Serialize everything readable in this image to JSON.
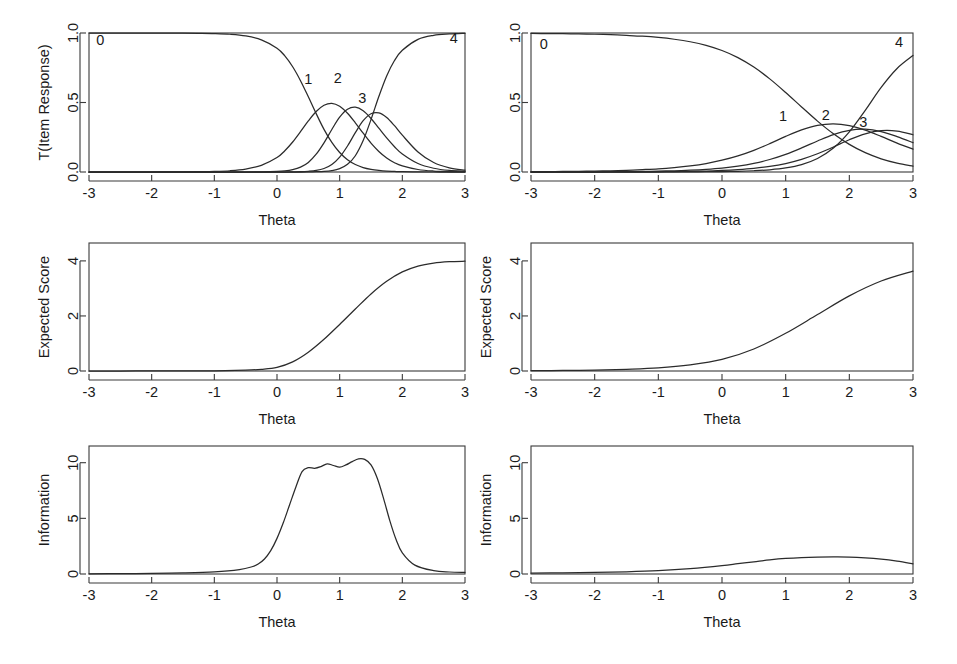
{
  "figure": {
    "width": 957,
    "height": 664,
    "background": "#ffffff",
    "line_color": "#2b2b2b",
    "axis_color": "#3a3a3a",
    "rows": 3,
    "cols": 2,
    "shared_xlabel": "Theta"
  },
  "chart_data": [
    {
      "id": "panel-trace-lines-item-1",
      "position": "top-left",
      "type": "line",
      "title": "",
      "xlabel": "Theta",
      "ylabel": "T(Item Response)",
      "xlim": [
        -3,
        3
      ],
      "ylim": [
        0,
        1
      ],
      "xticks": [
        -3,
        -2,
        -1,
        0,
        1,
        2,
        3
      ],
      "xticklabels": [
        "-3",
        "-2",
        "-1",
        "0",
        "1",
        "2",
        "3"
      ],
      "yticks": [
        0.0,
        0.5,
        1.0
      ],
      "yticklabels": [
        "0.0",
        "0.5",
        "1.0"
      ],
      "grid": false,
      "legend": "inline-curve-labels",
      "x": [
        -3.0,
        -2.75,
        -2.5,
        -2.25,
        -2.0,
        -1.75,
        -1.5,
        -1.25,
        -1.0,
        -0.75,
        -0.5,
        -0.25,
        0.0,
        0.125,
        0.25,
        0.375,
        0.5,
        0.625,
        0.75,
        0.875,
        1.0,
        1.125,
        1.25,
        1.375,
        1.5,
        1.625,
        1.75,
        1.875,
        2.0,
        2.25,
        2.5,
        2.75,
        3.0
      ],
      "series": [
        {
          "name": "0",
          "label": "0",
          "label_x": -2.82,
          "label_y": 0.94,
          "values": [
            1.0,
            1.0,
            1.0,
            1.0,
            1.0,
            0.999,
            0.999,
            0.998,
            0.996,
            0.991,
            0.979,
            0.951,
            0.891,
            0.835,
            0.757,
            0.657,
            0.541,
            0.42,
            0.307,
            0.213,
            0.14,
            0.088,
            0.054,
            0.032,
            0.019,
            0.011,
            0.006,
            0.004,
            0.002,
            0.001,
            0.0,
            0.0,
            0.0
          ]
        },
        {
          "name": "1",
          "label": "1",
          "label_x": 0.5,
          "label_y": 0.66,
          "values": [
            0.0,
            0.0,
            0.0,
            0.0,
            0.0,
            0.001,
            0.001,
            0.002,
            0.004,
            0.009,
            0.021,
            0.048,
            0.104,
            0.153,
            0.216,
            0.29,
            0.367,
            0.435,
            0.48,
            0.494,
            0.473,
            0.423,
            0.354,
            0.279,
            0.208,
            0.148,
            0.101,
            0.067,
            0.044,
            0.018,
            0.007,
            0.003,
            0.001
          ]
        },
        {
          "name": "2",
          "label": "2",
          "label_x": 0.97,
          "label_y": 0.665,
          "values": [
            0.0,
            0.0,
            0.0,
            0.0,
            0.0,
            0.0,
            0.0,
            0.0,
            0.0,
            0.0,
            0.0,
            0.001,
            0.004,
            0.008,
            0.017,
            0.035,
            0.069,
            0.128,
            0.21,
            0.306,
            0.394,
            0.451,
            0.466,
            0.44,
            0.385,
            0.315,
            0.245,
            0.182,
            0.13,
            0.061,
            0.027,
            0.011,
            0.005
          ]
        },
        {
          "name": "3",
          "label": "3",
          "label_x": 1.36,
          "label_y": 0.525,
          "values": [
            0.0,
            0.0,
            0.0,
            0.0,
            0.0,
            0.0,
            0.0,
            0.0,
            0.0,
            0.0,
            0.0,
            0.0,
            0.0,
            0.0,
            0.001,
            0.002,
            0.005,
            0.011,
            0.025,
            0.054,
            0.107,
            0.187,
            0.283,
            0.369,
            0.419,
            0.425,
            0.392,
            0.333,
            0.265,
            0.144,
            0.068,
            0.03,
            0.013
          ]
        },
        {
          "name": "4",
          "label": "4",
          "label_x": 2.82,
          "label_y": 0.955,
          "values": [
            0.0,
            0.0,
            0.0,
            0.0,
            0.0,
            0.0,
            0.0,
            0.0,
            0.0,
            0.0,
            0.0,
            0.0,
            0.0,
            0.0,
            0.0,
            0.0,
            0.001,
            0.002,
            0.004,
            0.01,
            0.024,
            0.055,
            0.117,
            0.226,
            0.377,
            0.543,
            0.691,
            0.802,
            0.876,
            0.954,
            0.983,
            0.993,
            0.998
          ]
        }
      ]
    },
    {
      "id": "panel-trace-lines-item-2",
      "position": "top-right",
      "type": "line",
      "title": "",
      "xlabel": "Theta",
      "ylabel": "",
      "xlim": [
        -3,
        3
      ],
      "ylim": [
        0,
        1
      ],
      "xticks": [
        -3,
        -2,
        -1,
        0,
        1,
        2,
        3
      ],
      "xticklabels": [
        "-3",
        "-2",
        "-1",
        "0",
        "1",
        "2",
        "3"
      ],
      "yticks": [
        0.0,
        0.5,
        1.0
      ],
      "yticklabels": [
        "0.0",
        "0.5",
        "1.0"
      ],
      "grid": false,
      "legend": "inline-curve-labels",
      "x": [
        -3.0,
        -2.75,
        -2.5,
        -2.25,
        -2.0,
        -1.75,
        -1.5,
        -1.25,
        -1.0,
        -0.75,
        -0.5,
        -0.25,
        0.0,
        0.25,
        0.5,
        0.75,
        1.0,
        1.25,
        1.5,
        1.75,
        2.0,
        2.25,
        2.5,
        2.75,
        3.0
      ],
      "series": [
        {
          "name": "0",
          "label": "0",
          "label_x": -2.8,
          "label_y": 0.915,
          "values": [
            0.997,
            0.996,
            0.995,
            0.993,
            0.991,
            0.988,
            0.983,
            0.977,
            0.968,
            0.955,
            0.937,
            0.911,
            0.874,
            0.823,
            0.755,
            0.67,
            0.572,
            0.468,
            0.366,
            0.275,
            0.199,
            0.139,
            0.095,
            0.064,
            0.042
          ]
        },
        {
          "name": "1",
          "label": "1",
          "label_x": 0.96,
          "label_y": 0.395,
          "values": [
            0.002,
            0.003,
            0.004,
            0.005,
            0.007,
            0.009,
            0.012,
            0.017,
            0.023,
            0.032,
            0.044,
            0.061,
            0.085,
            0.116,
            0.156,
            0.204,
            0.256,
            0.303,
            0.336,
            0.347,
            0.334,
            0.301,
            0.256,
            0.208,
            0.164
          ]
        },
        {
          "name": "2",
          "label": "2",
          "label_x": 1.63,
          "label_y": 0.4,
          "values": [
            0.0,
            0.0,
            0.001,
            0.001,
            0.001,
            0.002,
            0.003,
            0.004,
            0.006,
            0.009,
            0.013,
            0.019,
            0.028,
            0.042,
            0.062,
            0.09,
            0.127,
            0.173,
            0.223,
            0.269,
            0.3,
            0.308,
            0.291,
            0.255,
            0.211
          ]
        },
        {
          "name": "3",
          "label": "3",
          "label_x": 2.22,
          "label_y": 0.35,
          "values": [
            0.0,
            0.0,
            0.0,
            0.0,
            0.0,
            0.001,
            0.001,
            0.001,
            0.002,
            0.003,
            0.005,
            0.007,
            0.011,
            0.017,
            0.026,
            0.04,
            0.061,
            0.091,
            0.131,
            0.18,
            0.232,
            0.275,
            0.297,
            0.294,
            0.268
          ]
        },
        {
          "name": "4",
          "label": "4",
          "label_x": 2.78,
          "label_y": 0.925,
          "values": [
            0.0,
            0.0,
            0.0,
            0.0,
            0.0,
            0.0,
            0.0,
            0.0,
            0.0,
            0.001,
            0.001,
            0.002,
            0.003,
            0.005,
            0.009,
            0.016,
            0.029,
            0.053,
            0.097,
            0.172,
            0.289,
            0.444,
            0.609,
            0.745,
            0.838
          ]
        }
      ]
    },
    {
      "id": "panel-expected-score-item-1",
      "position": "middle-left",
      "type": "line",
      "title": "",
      "xlabel": "Theta",
      "ylabel": "Expected Score",
      "xlim": [
        -3,
        3
      ],
      "ylim": [
        0,
        4.65
      ],
      "xticks": [
        -3,
        -2,
        -1,
        0,
        1,
        2,
        3
      ],
      "xticklabels": [
        "-3",
        "-2",
        "-1",
        "0",
        "1",
        "2",
        "3"
      ],
      "yticks": [
        0,
        2,
        4
      ],
      "yticklabels": [
        "0",
        "2",
        "4"
      ],
      "grid": false,
      "x": [
        -3.0,
        -2.5,
        -2.0,
        -1.5,
        -1.0,
        -0.5,
        -0.25,
        0.0,
        0.25,
        0.5,
        0.75,
        1.0,
        1.25,
        1.5,
        1.75,
        2.0,
        2.25,
        2.5,
        2.75,
        3.0
      ],
      "series": [
        {
          "name": "Expected Score",
          "label": "",
          "values": [
            0.0,
            0.0,
            0.001,
            0.002,
            0.008,
            0.03,
            0.06,
            0.13,
            0.33,
            0.68,
            1.15,
            1.69,
            2.25,
            2.8,
            3.26,
            3.6,
            3.81,
            3.92,
            3.97,
            3.99
          ]
        }
      ]
    },
    {
      "id": "panel-expected-score-item-2",
      "position": "middle-right",
      "type": "line",
      "title": "",
      "xlabel": "Theta",
      "ylabel": "Expected Score",
      "xlim": [
        -3,
        3
      ],
      "ylim": [
        0,
        4.65
      ],
      "xticks": [
        -3,
        -2,
        -1,
        0,
        1,
        2,
        3
      ],
      "xticklabels": [
        "-3",
        "-2",
        "-1",
        "0",
        "1",
        "2",
        "3"
      ],
      "yticks": [
        0,
        2,
        4
      ],
      "yticklabels": [
        "0",
        "2",
        "4"
      ],
      "grid": false,
      "x": [
        -3.0,
        -2.5,
        -2.0,
        -1.5,
        -1.0,
        -0.5,
        0.0,
        0.5,
        1.0,
        1.5,
        2.0,
        2.5,
        3.0
      ],
      "series": [
        {
          "name": "Expected Score",
          "label": "",
          "values": [
            0.01,
            0.02,
            0.03,
            0.06,
            0.11,
            0.22,
            0.42,
            0.8,
            1.37,
            2.05,
            2.73,
            3.27,
            3.63
          ]
        }
      ]
    },
    {
      "id": "panel-information-item-1",
      "position": "bottom-left",
      "type": "line",
      "title": "",
      "xlabel": "Theta",
      "ylabel": "Information",
      "xlim": [
        -3,
        3
      ],
      "ylim": [
        0,
        11.5
      ],
      "xticks": [
        -3,
        -2,
        -1,
        0,
        1,
        2,
        3
      ],
      "xticklabels": [
        "-3",
        "-2",
        "-1",
        "0",
        "1",
        "2",
        "3"
      ],
      "yticks": [
        0,
        5,
        10
      ],
      "yticklabels": [
        "0",
        "5",
        "10"
      ],
      "grid": false,
      "x": [
        -3.0,
        -2.5,
        -2.0,
        -1.5,
        -1.0,
        -0.6,
        -0.4,
        -0.3,
        -0.2,
        -0.1,
        0.0,
        0.1,
        0.2,
        0.3,
        0.4,
        0.5,
        0.6,
        0.7,
        0.8,
        0.9,
        1.0,
        1.1,
        1.2,
        1.3,
        1.4,
        1.5,
        1.6,
        1.7,
        1.8,
        1.9,
        2.0,
        2.2,
        2.5,
        2.75,
        3.0
      ],
      "series": [
        {
          "name": "Information",
          "label": "",
          "values": [
            0.02,
            0.03,
            0.05,
            0.1,
            0.2,
            0.4,
            0.65,
            0.9,
            1.35,
            2.1,
            3.2,
            4.6,
            6.2,
            7.8,
            9.2,
            9.55,
            9.5,
            9.65,
            9.9,
            9.75,
            9.6,
            9.8,
            10.1,
            10.35,
            10.3,
            9.8,
            8.6,
            6.8,
            4.8,
            3.1,
            1.9,
            0.8,
            0.3,
            0.18,
            0.15
          ]
        }
      ]
    },
    {
      "id": "panel-information-item-2",
      "position": "bottom-right",
      "type": "line",
      "title": "",
      "xlabel": "Theta",
      "ylabel": "Information",
      "xlim": [
        -3,
        3
      ],
      "ylim": [
        0,
        11.5
      ],
      "xticks": [
        -3,
        -2,
        -1,
        0,
        1,
        2,
        3
      ],
      "xticklabels": [
        "-3",
        "-2",
        "-1",
        "0",
        "1",
        "2",
        "3"
      ],
      "yticks": [
        0,
        5,
        10
      ],
      "yticklabels": [
        "0",
        "5",
        "10"
      ],
      "grid": false,
      "x": [
        -3.0,
        -2.5,
        -2.0,
        -1.5,
        -1.0,
        -0.5,
        0.0,
        0.25,
        0.5,
        0.75,
        1.0,
        1.25,
        1.5,
        1.75,
        2.0,
        2.25,
        2.5,
        2.75,
        3.0
      ],
      "series": [
        {
          "name": "Information",
          "label": "",
          "values": [
            0.08,
            0.1,
            0.14,
            0.2,
            0.3,
            0.48,
            0.75,
            0.93,
            1.1,
            1.27,
            1.4,
            1.48,
            1.52,
            1.53,
            1.52,
            1.45,
            1.33,
            1.15,
            0.92
          ]
        }
      ]
    }
  ]
}
